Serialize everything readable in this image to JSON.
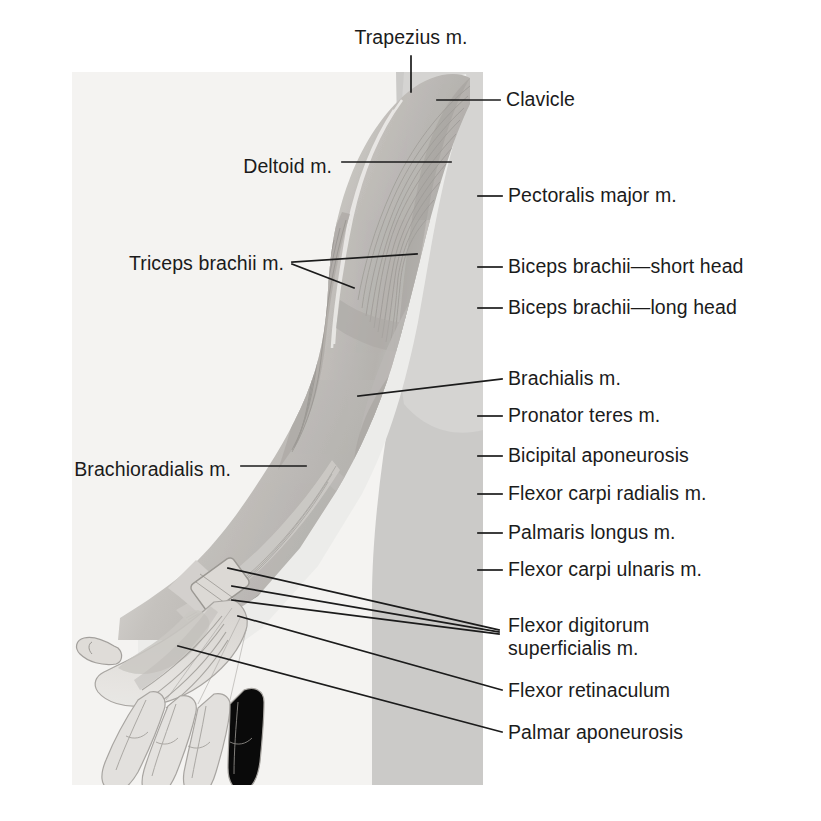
{
  "figure": {
    "background_color": "#ffffff",
    "panel": {
      "fill": "#f3f2f0",
      "x": 72,
      "y": 72,
      "width": 411,
      "height": 713
    },
    "torso_band_color": "#c9c8c6",
    "ink_color": "#1b1b1b",
    "muscle_light": "#dedcd9",
    "muscle_mid": "#bdbab6",
    "muscle_dark": "#9a9794"
  },
  "labels": {
    "trapezius": {
      "text": "Trapezius m.",
      "x": 411,
      "y": 38,
      "side": "center"
    },
    "clavicle": {
      "text": "Clavicle",
      "x": 506,
      "y": 100,
      "side": "right"
    },
    "deltoid": {
      "text": "Deltoid m.",
      "x": 332,
      "y": 167,
      "side": "left"
    },
    "pectoralis_major": {
      "text": "Pectoralis major m.",
      "x": 508,
      "y": 196,
      "side": "right"
    },
    "triceps_brachii": {
      "text": "Triceps brachii m.",
      "x": 284,
      "y": 264,
      "side": "left"
    },
    "biceps_short": {
      "text": "Biceps brachii—short head",
      "x": 508,
      "y": 267,
      "side": "right"
    },
    "biceps_long": {
      "text": "Biceps brachii—long head",
      "x": 508,
      "y": 308,
      "side": "right"
    },
    "brachialis": {
      "text": "Brachialis m.",
      "x": 508,
      "y": 379,
      "side": "right"
    },
    "pronator_teres": {
      "text": "Pronator teres m.",
      "x": 508,
      "y": 416,
      "side": "right"
    },
    "bicipital_apo": {
      "text": "Bicipital aponeurosis",
      "x": 508,
      "y": 456,
      "side": "right"
    },
    "brachioradialis": {
      "text": "Brachioradialis m.",
      "x": 231,
      "y": 470,
      "side": "left"
    },
    "flexor_carpi_rad": {
      "text": "Flexor carpi radialis m.",
      "x": 508,
      "y": 494,
      "side": "right"
    },
    "palmaris_longus": {
      "text": "Palmaris longus m.",
      "x": 508,
      "y": 533,
      "side": "right"
    },
    "flexor_carpi_uln": {
      "text": "Flexor carpi ulnaris m.",
      "x": 508,
      "y": 570,
      "side": "right"
    },
    "flexor_dig_sup_1": {
      "text": "Flexor digitorum",
      "x": 508,
      "y": 626,
      "side": "right"
    },
    "flexor_dig_sup_2": {
      "text": "superficialis m.",
      "x": 508,
      "y": 649,
      "side": "right"
    },
    "flexor_retinac": {
      "text": "Flexor retinaculum",
      "x": 508,
      "y": 691,
      "side": "right"
    },
    "palmar_apo": {
      "text": "Palmar aponeurosis",
      "x": 508,
      "y": 733,
      "side": "right"
    }
  },
  "leaders": {
    "trapezius": {
      "points": "411,56 411,92"
    },
    "clavicle": {
      "points": "437,100 500,100"
    },
    "deltoid": {
      "points": "342,162 451,162"
    },
    "pectoralis_major": {
      "points": "478,196 502,196"
    },
    "triceps_brachii_a": {
      "points": "292,262 417,254"
    },
    "triceps_brachii_b": {
      "points": "292,264 354,288"
    },
    "biceps_short": {
      "points": "478,267 502,267"
    },
    "biceps_long": {
      "points": "478,308 502,308"
    },
    "brachialis": {
      "points": "358,396 502,379"
    },
    "pronator_teres": {
      "points": "478,416 502,416"
    },
    "bicipital_apo": {
      "points": "478,456 502,456"
    },
    "brachioradialis": {
      "points": "241,466 306,466"
    },
    "flexor_carpi_rad": {
      "points": "478,494 502,494"
    },
    "palmaris_longus": {
      "points": "478,533 502,533"
    },
    "flexor_carpi_uln": {
      "points": "478,570 502,570"
    },
    "fds_a": {
      "points": "228,568 499,630"
    },
    "fds_b": {
      "points": "232,586 499,632"
    },
    "fds_c": {
      "points": "232,600 499,634"
    },
    "flexor_retinac": {
      "points": "238,616 502,690"
    },
    "palmar_apo": {
      "points": "178,646 502,732"
    }
  }
}
